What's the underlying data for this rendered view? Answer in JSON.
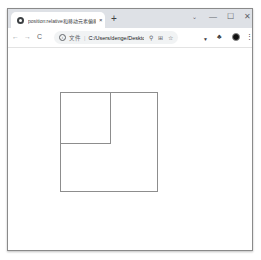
{
  "browser": {
    "tab": {
      "title": "position:relative和移动元素偏移",
      "close_glyph": "×",
      "favicon": "globe-icon"
    },
    "new_tab_glyph": "+",
    "tab_search_glyph": "⌄",
    "window_controls": {
      "minimize": "—",
      "maximize": "☐",
      "close": "✕"
    },
    "toolbar": {
      "back": "←",
      "forward": "→",
      "reload": "C",
      "info_glyph": "i",
      "scheme_label": "文件",
      "separator": "|",
      "url": "C:/Users/denge/Desktop/书籍...",
      "zoom_icon": "⚲",
      "share_icon": "⊞",
      "bookmark_icon": "☆",
      "extension_icon": "▼",
      "puzzle_icon": "♣",
      "menu_icon": "⋮"
    }
  },
  "page": {
    "outer_box": {
      "border_color": "#8d8d8d"
    },
    "inner_box": {
      "border_color": "#8d8d8d"
    }
  }
}
